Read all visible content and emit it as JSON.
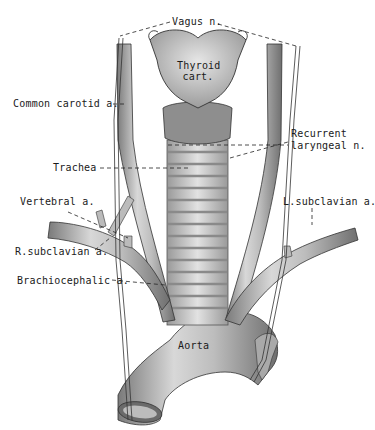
{
  "figure": {
    "style": "grayscale anatomical illustration",
    "colors": {
      "background": "#ffffff",
      "vessel_fill": "#c8c8c8",
      "vessel_shade": "#8a8a8a",
      "line": "#222222",
      "text": "#1a1a1a"
    }
  },
  "labels": {
    "vagus": "Vagus n.",
    "thyroid_line1": "Thyroid",
    "thyroid_line2": "cart.",
    "common_carotid": "Common carotid a.",
    "recurrent_line1": "Recurrent",
    "recurrent_line2": "laryngeal n.",
    "trachea": "Trachea",
    "vertebral": "Vertebral a.",
    "l_subclavian": "L.subclavian a.",
    "r_subclavian": "R.subclavian a.",
    "brachiocephalic": "Brachiocephalic a.",
    "aorta": "Aorta"
  }
}
